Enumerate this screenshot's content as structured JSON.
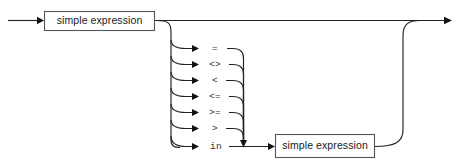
{
  "diagram": {
    "type": "railroad-syntax-diagram",
    "title": "expression",
    "background_color": "#ffffff",
    "line_color": "#222222",
    "text_color": "#1a1a1a",
    "entry_arrow": "arrow-right",
    "exit_arrow": "arrow-right"
  },
  "boxes": [
    {
      "id": "left-expr",
      "label": "simple expression",
      "x": 44,
      "y": 11,
      "w": 111,
      "h": 20
    },
    {
      "id": "right-expr",
      "label": "simple expression",
      "x": 275,
      "y": 134,
      "w": 100,
      "h": 24
    }
  ],
  "operators": [
    {
      "label": "=",
      "y": 48
    },
    {
      "label": "<>",
      "y": 64
    },
    {
      "label": "<",
      "y": 80
    },
    {
      "label": "<=",
      "y": 96
    },
    {
      "label": ">=",
      "y": 112
    },
    {
      "label": ">",
      "y": 128
    },
    {
      "label": "in",
      "y": 146
    }
  ]
}
